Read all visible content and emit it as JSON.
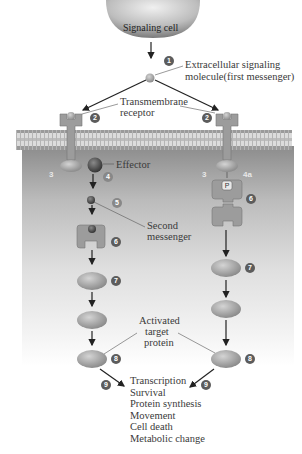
{
  "figure": {
    "signaling_cell": "Signaling cell",
    "labels": {
      "first_messenger": [
        "Extracellular signaling",
        "molecule(first messenger)"
      ],
      "receptor": [
        "Transmembrane",
        "receptor"
      ],
      "effector": "Effector",
      "second_messenger": [
        "Second",
        "messenger"
      ],
      "target_protein": [
        "Activated",
        "target",
        "protein"
      ]
    },
    "phosphate": "P",
    "steps": {
      "s1": "1",
      "s2": "2",
      "s3": "3",
      "s4": "4",
      "s4a": "4a",
      "s5": "5",
      "s6": "6",
      "s7": "7",
      "s8": "8",
      "s9": "9"
    },
    "outcomes": [
      "Transcription",
      "Survival",
      "Protein synthesis",
      "Movement",
      "Cell death",
      "Metabolic change"
    ],
    "colors": {
      "protein": "#9a9a9a",
      "step_badge": "#5c5c5c",
      "arrow": "#222222"
    }
  }
}
